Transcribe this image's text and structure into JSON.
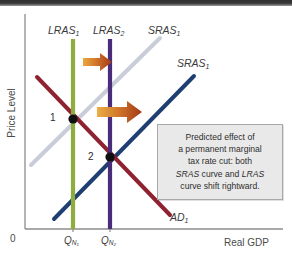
{
  "figure": {
    "type": "economics-ad-as-diagram",
    "background": "#ffffff",
    "top_band_color": "#2f2f2f"
  },
  "axes": {
    "y_label": "Price Level",
    "x_label": "Real GDP",
    "origin_label": "0",
    "axis_color": "#8d8d8d",
    "x_ticks": [
      {
        "id": "qn1",
        "label_main": "Q",
        "label_sub": "N",
        "label_sub2": "1",
        "x_px": 73
      },
      {
        "id": "qn2",
        "label_main": "Q",
        "label_sub": "N",
        "label_sub2": "2",
        "x_px": 110
      }
    ]
  },
  "curves": [
    {
      "name": "LRAS1",
      "label_main": "LRAS",
      "label_sub": "1",
      "color": "#8fac3e",
      "kind": "vertical",
      "x_px": 73
    },
    {
      "name": "LRAS2",
      "label_main": "LRAS",
      "label_sub": "2",
      "color": "#4a2d7a",
      "kind": "vertical",
      "x_px": 110
    },
    {
      "name": "SRAS1_initial",
      "label_main": "SRAS",
      "label_sub": "1",
      "color": "#c9cdd9",
      "kind": "upward-sloping"
    },
    {
      "name": "SRAS1_shifted",
      "label_main": "SRAS",
      "label_sub": "1",
      "color": "#1f3f73",
      "kind": "upward-sloping"
    },
    {
      "name": "AD1",
      "label_main": "AD",
      "label_sub": "1",
      "color": "#8f2230",
      "kind": "downward-sloping"
    }
  ],
  "equilibria": [
    {
      "label": "1",
      "color": "#111111"
    },
    {
      "label": "2",
      "color": "#111111"
    }
  ],
  "shift_arrows": [
    {
      "name": "upper-shift-arrow",
      "color_start": "#e8a43c",
      "color_end": "#a63a1c"
    },
    {
      "name": "lower-shift-arrow",
      "color_start": "#e8a43c",
      "color_end": "#a63a1c"
    }
  ],
  "callout": {
    "line1": "Predicted effect of",
    "line2": "a permanent marginal",
    "line3": "tax rate cut: both",
    "line4_pre": "",
    "line4_em1": "SRAS",
    "line4_mid": " curve and ",
    "line4_em2": "LRAS",
    "line5": "curve shift rightward.",
    "background": "#e9e9e9",
    "border_color": "#a8a8a8"
  }
}
